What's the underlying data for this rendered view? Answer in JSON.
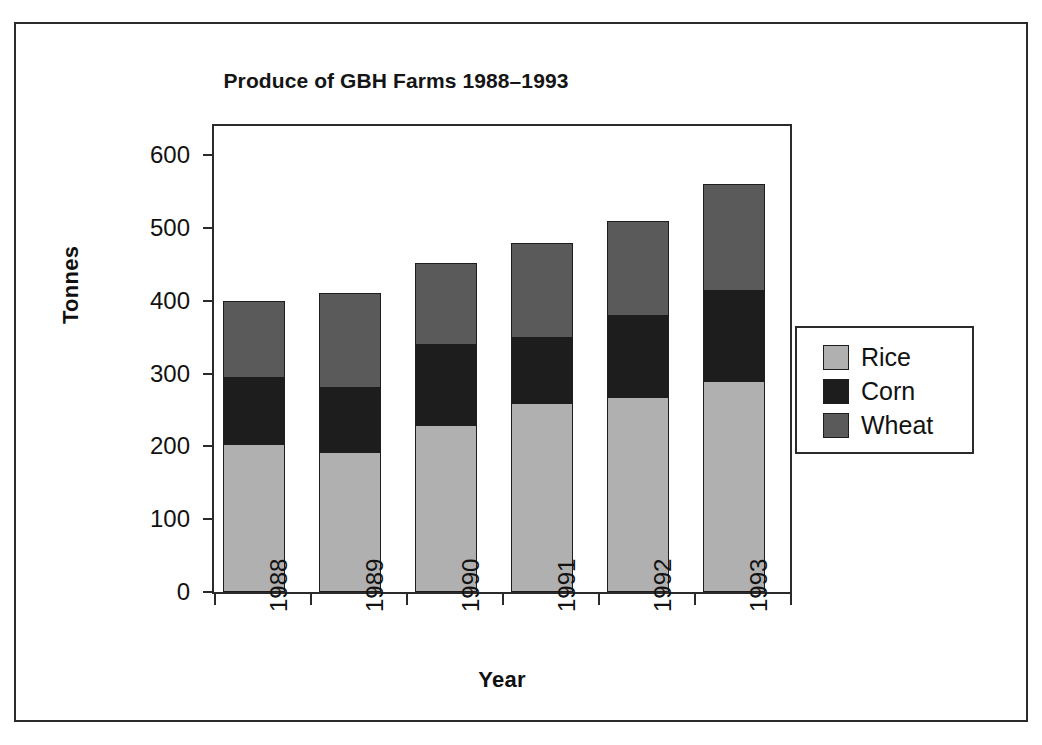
{
  "chart_data": {
    "type": "bar",
    "subtype": "stacked-bar",
    "title": "Produce of GBH Farms 1988–1993",
    "xlabel": "Year",
    "ylabel": "Tonnes",
    "categories": [
      "1988",
      "1989",
      "1990",
      "1991",
      "1992",
      "1993"
    ],
    "series": [
      {
        "name": "Rice",
        "color": "#b0b0b0",
        "values": [
          203,
          192,
          230,
          260,
          268,
          290
        ]
      },
      {
        "name": "Corn",
        "color": "#1d1d1d",
        "values": [
          92,
          90,
          110,
          90,
          112,
          125
        ]
      },
      {
        "name": "Wheat",
        "color": "#5a5a5a",
        "values": [
          105,
          128,
          112,
          130,
          130,
          145
        ]
      }
    ],
    "totals": [
      400,
      410,
      452,
      480,
      510,
      560
    ],
    "ylim": [
      0,
      640
    ],
    "yticks": [
      0,
      100,
      200,
      300,
      400,
      500,
      600
    ],
    "ytick_labels": [
      "0",
      "100",
      "200",
      "300",
      "400",
      "500",
      "600"
    ],
    "grid": false,
    "legend_position": "right",
    "stack_order_bottom_to_top": [
      "Rice",
      "Corn",
      "Wheat"
    ]
  },
  "legend": {
    "entries": [
      {
        "label": "Rice",
        "color": "#b0b0b0"
      },
      {
        "label": "Corn",
        "color": "#1d1d1d"
      },
      {
        "label": "Wheat",
        "color": "#5a5a5a"
      }
    ]
  },
  "axes": {
    "y_axis_title": "Tonnes",
    "x_axis_title": "Year"
  }
}
